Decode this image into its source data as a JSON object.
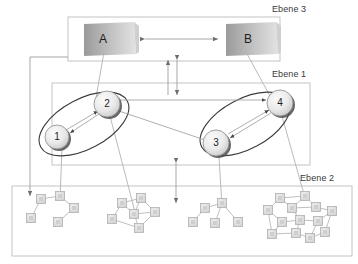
{
  "diagram": {
    "title_language": "de",
    "layers": [
      {
        "id": "ebene3",
        "label": "Ebene 3",
        "label_x": 272,
        "label_y": 5,
        "frame": {
          "x": 68,
          "y": 17,
          "w": 212,
          "h": 44
        }
      },
      {
        "id": "ebene1",
        "label": "Ebene 1",
        "label_x": 272,
        "label_y": 70,
        "frame": {
          "x": 52,
          "y": 83,
          "w": 258,
          "h": 82
        }
      },
      {
        "id": "ebene2",
        "label": "Ebene 2",
        "label_x": 300,
        "label_y": 174,
        "frame": {
          "x": 12,
          "y": 186,
          "w": 340,
          "h": 70
        }
      }
    ],
    "layer3_boxes": [
      {
        "id": "A",
        "label": "A",
        "x": 82,
        "y": 22,
        "w": 56,
        "h": 33
      },
      {
        "id": "B",
        "label": "B",
        "x": 224,
        "y": 22,
        "w": 56,
        "h": 33
      }
    ],
    "layer3_link": {
      "from": "B",
      "to": "A",
      "type": "bidirectional",
      "y": 39
    },
    "ellipses": [
      {
        "id": "group-left",
        "cx": 84,
        "cy": 124,
        "rx": 49,
        "ry": 25,
        "rotate": -28
      },
      {
        "id": "group-right",
        "cx": 245,
        "cy": 124,
        "rx": 49,
        "ry": 25,
        "rotate": -28
      }
    ],
    "nodes": [
      {
        "id": "n1",
        "label": "1",
        "cx": 57,
        "cy": 137,
        "r": 12
      },
      {
        "id": "n2",
        "label": "2",
        "cx": 107,
        "cy": 104,
        "r": 13
      },
      {
        "id": "n3",
        "label": "3",
        "cx": 216,
        "cy": 143,
        "r": 13
      },
      {
        "id": "n4",
        "label": "4",
        "cx": 280,
        "cy": 103,
        "r": 13
      }
    ],
    "node_links": [
      {
        "from": "n2",
        "to": "n1",
        "type": "arrow"
      },
      {
        "from": "n1",
        "to": "n2",
        "type": "arrow"
      },
      {
        "from": "n4",
        "to": "n3",
        "type": "arrow"
      },
      {
        "from": "n3",
        "to": "n4",
        "type": "arrow"
      },
      {
        "from": "n2",
        "to": "n3",
        "type": "line"
      },
      {
        "from": "n2",
        "to": "n4",
        "type": "arrow"
      }
    ],
    "vertical_connectors": [
      {
        "id": "l3-to-l1-left",
        "x": 168,
        "y1": 60,
        "y2": 95,
        "heads": "up"
      },
      {
        "id": "l3-to-l1-right",
        "x": 177,
        "y1": 60,
        "y2": 95,
        "heads": "both"
      },
      {
        "id": "l1-to-l2",
        "x": 176,
        "y1": 163,
        "y2": 203,
        "heads": "both"
      }
    ],
    "mapping_lines": [
      {
        "id": "A-to-n2",
        "from_x": 104,
        "from_y": 52,
        "to_x": 96,
        "to_y": 98
      },
      {
        "id": "B-to-n4",
        "from_x": 246,
        "from_y": 52,
        "to_x": 270,
        "to_y": 96
      },
      {
        "id": "n1-to-cluster1",
        "from_x": 62,
        "from_y": 148,
        "to_x": 60,
        "to_y": 200
      },
      {
        "id": "n2-to-cluster2",
        "from_x": 110,
        "from_y": 116,
        "to_x": 135,
        "to_y": 212
      },
      {
        "id": "n3-to-cluster3",
        "from_x": 219,
        "from_y": 157,
        "to_x": 222,
        "to_y": 208
      },
      {
        "id": "n4-to-cluster4",
        "from_x": 282,
        "from_y": 116,
        "to_x": 305,
        "to_y": 200
      }
    ],
    "side_connector": {
      "id": "frame-to-cluster1",
      "path": "M 68,57 L 30,57 L 30,196"
    },
    "clusters": [
      {
        "id": "cluster-1",
        "nodes": [
          {
            "x": 41,
            "y": 199
          },
          {
            "x": 60,
            "y": 196
          },
          {
            "x": 74,
            "y": 208
          },
          {
            "x": 31,
            "y": 218
          },
          {
            "x": 58,
            "y": 222
          }
        ],
        "edges": [
          [
            0,
            1
          ],
          [
            1,
            2
          ],
          [
            0,
            3
          ],
          [
            2,
            4
          ]
        ]
      },
      {
        "id": "cluster-2",
        "nodes": [
          {
            "x": 122,
            "y": 203
          },
          {
            "x": 141,
            "y": 198
          },
          {
            "x": 134,
            "y": 214
          },
          {
            "x": 155,
            "y": 212
          },
          {
            "x": 112,
            "y": 219
          },
          {
            "x": 139,
            "y": 228
          }
        ],
        "edges": [
          [
            0,
            1
          ],
          [
            0,
            2
          ],
          [
            1,
            2
          ],
          [
            1,
            3
          ],
          [
            2,
            3
          ],
          [
            0,
            4
          ],
          [
            4,
            5
          ],
          [
            2,
            5
          ],
          [
            5,
            3
          ]
        ]
      },
      {
        "id": "cluster-3",
        "nodes": [
          {
            "x": 205,
            "y": 208
          },
          {
            "x": 222,
            "y": 203
          },
          {
            "x": 193,
            "y": 222
          },
          {
            "x": 215,
            "y": 223
          },
          {
            "x": 238,
            "y": 222
          }
        ],
        "edges": [
          [
            0,
            1
          ],
          [
            0,
            2
          ],
          [
            1,
            3
          ],
          [
            1,
            4
          ]
        ]
      },
      {
        "id": "cluster-4",
        "nodes": [
          {
            "x": 280,
            "y": 198
          },
          {
            "x": 305,
            "y": 196
          },
          {
            "x": 292,
            "y": 208
          },
          {
            "x": 316,
            "y": 207
          },
          {
            "x": 268,
            "y": 210
          },
          {
            "x": 332,
            "y": 211
          },
          {
            "x": 300,
            "y": 220
          },
          {
            "x": 282,
            "y": 222
          },
          {
            "x": 318,
            "y": 221
          },
          {
            "x": 272,
            "y": 234
          },
          {
            "x": 296,
            "y": 233
          },
          {
            "x": 325,
            "y": 232
          },
          {
            "x": 310,
            "y": 238
          }
        ],
        "edges": [
          [
            0,
            1
          ],
          [
            0,
            2
          ],
          [
            1,
            3
          ],
          [
            2,
            3
          ],
          [
            0,
            4
          ],
          [
            3,
            5
          ],
          [
            2,
            6
          ],
          [
            6,
            7
          ],
          [
            4,
            7
          ],
          [
            6,
            8
          ],
          [
            8,
            5
          ],
          [
            7,
            9
          ],
          [
            6,
            10
          ],
          [
            9,
            10
          ],
          [
            10,
            12
          ],
          [
            8,
            12
          ],
          [
            12,
            11
          ],
          [
            11,
            5
          ],
          [
            4,
            9
          ],
          [
            1,
            2
          ]
        ]
      }
    ],
    "style": {
      "frame_stroke": "#b8b8b8",
      "arrow_stroke": "#8a8a8a",
      "ellipse_stroke": "#3c3c3c",
      "node_stroke": "#8c8c8c",
      "node_fill_light": "#f2f2f2",
      "node_fill_dark": "#c9c9c9",
      "box_fill_dark": "#9e9e9e",
      "box_fill_light": "#dcdcdc",
      "cluster_stroke": "#b0b0b0",
      "cluster_fill": "#dedede",
      "shadow": "#2e2e2e"
    }
  }
}
